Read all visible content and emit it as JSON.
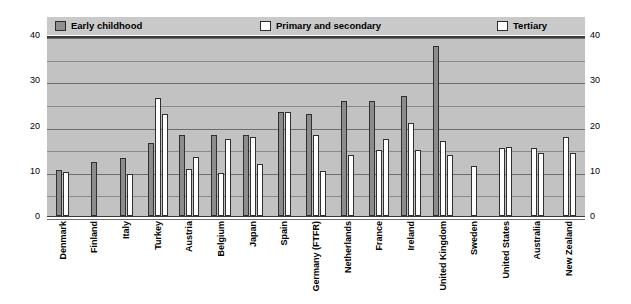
{
  "legend": {
    "items": [
      {
        "label": "Early childhood",
        "key": "early",
        "swatch": "dark",
        "color": "#8f8f8f"
      },
      {
        "label": "Primary and secondary",
        "key": "primary",
        "swatch": "light",
        "color": "#ffffff"
      },
      {
        "label": "Tertiary",
        "key": "tertiary",
        "swatch": "light",
        "color": "#ffffff"
      }
    ]
  },
  "axis": {
    "y_ticks_left": [
      "40",
      "30",
      "20",
      "10",
      "0"
    ],
    "y_ticks_right": [
      "40",
      "30",
      "20",
      "10",
      "0"
    ]
  },
  "chart_data": {
    "type": "bar",
    "title": "",
    "xlabel": "",
    "ylabel": "",
    "ylim": [
      0,
      40
    ],
    "ytick_step": 10,
    "gridline_step": 5,
    "grid": true,
    "legend_position": "top",
    "categories": [
      "Denmark",
      "Finland",
      "Italy",
      "Turkey",
      "Austria",
      "Belgium",
      "Japan",
      "Spain",
      "Germany (FTFR)",
      "Netherlands",
      "France",
      "Ireland",
      "United Kingdom",
      "Sweden",
      "United States",
      "Australia",
      "New Zealand"
    ],
    "series": [
      {
        "name": "Early childhood",
        "color": "#8c8c8c",
        "values": [
          10.2,
          12.0,
          12.8,
          16.2,
          18.0,
          18.0,
          18.0,
          23.0,
          22.5,
          25.5,
          25.5,
          26.5,
          37.5,
          null,
          null,
          null,
          null
        ]
      },
      {
        "name": "Primary and secondary",
        "color": "#ffffff",
        "values": [
          9.8,
          null,
          9.2,
          26.0,
          10.5,
          9.5,
          17.5,
          23.0,
          18.0,
          13.5,
          14.5,
          20.5,
          16.5,
          11.0,
          15.0,
          15.0,
          17.5
        ]
      },
      {
        "name": "Tertiary",
        "color": "#ffffff",
        "values": [
          null,
          null,
          null,
          22.5,
          13.0,
          17.0,
          11.5,
          null,
          10.0,
          null,
          17.0,
          14.5,
          13.5,
          null,
          15.3,
          14.0,
          14.0
        ]
      }
    ]
  }
}
